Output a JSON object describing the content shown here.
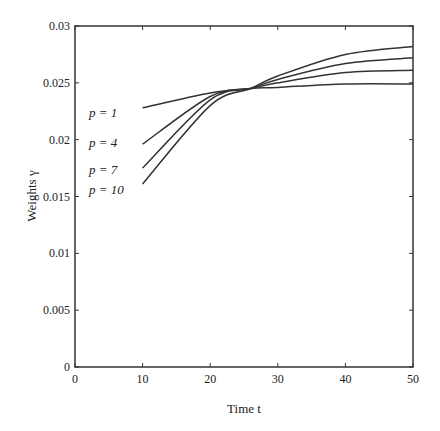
{
  "chart_data": {
    "type": "line",
    "title": "",
    "xlabel": "Time t",
    "ylabel": "Weights γ",
    "xlim": [
      0,
      50
    ],
    "ylim": [
      0,
      0.03
    ],
    "xticks": [
      0,
      10,
      20,
      30,
      40,
      50
    ],
    "xtick_labels": [
      "0",
      "10",
      "20",
      "30",
      "40",
      "50"
    ],
    "yticks": [
      0,
      0.005,
      0.01,
      0.015,
      0.02,
      0.025,
      0.03
    ],
    "ytick_labels": [
      "0",
      "0.005",
      "0.01",
      "0.015",
      "0.02",
      "0.025",
      "0.03"
    ],
    "grid": false,
    "legend_position": "inline-left",
    "x": [
      10,
      20,
      26,
      30,
      40,
      50
    ],
    "series": [
      {
        "name": "p = 1",
        "values": [
          0.0228,
          0.0241,
          0.0245,
          0.0246,
          0.0249,
          0.0249
        ]
      },
      {
        "name": "p = 4",
        "values": [
          0.0196,
          0.0238,
          0.0245,
          0.025,
          0.0259,
          0.0261
        ]
      },
      {
        "name": "p = 7",
        "values": [
          0.0175,
          0.0235,
          0.0245,
          0.0253,
          0.0267,
          0.0272
        ]
      },
      {
        "name": "p = 10",
        "values": [
          0.0161,
          0.023,
          0.0245,
          0.0256,
          0.0275,
          0.0282
        ]
      }
    ],
    "annotations": [
      "p = 1",
      "p = 4",
      "p = 7",
      "p = 10"
    ],
    "line_color": "#333333"
  }
}
